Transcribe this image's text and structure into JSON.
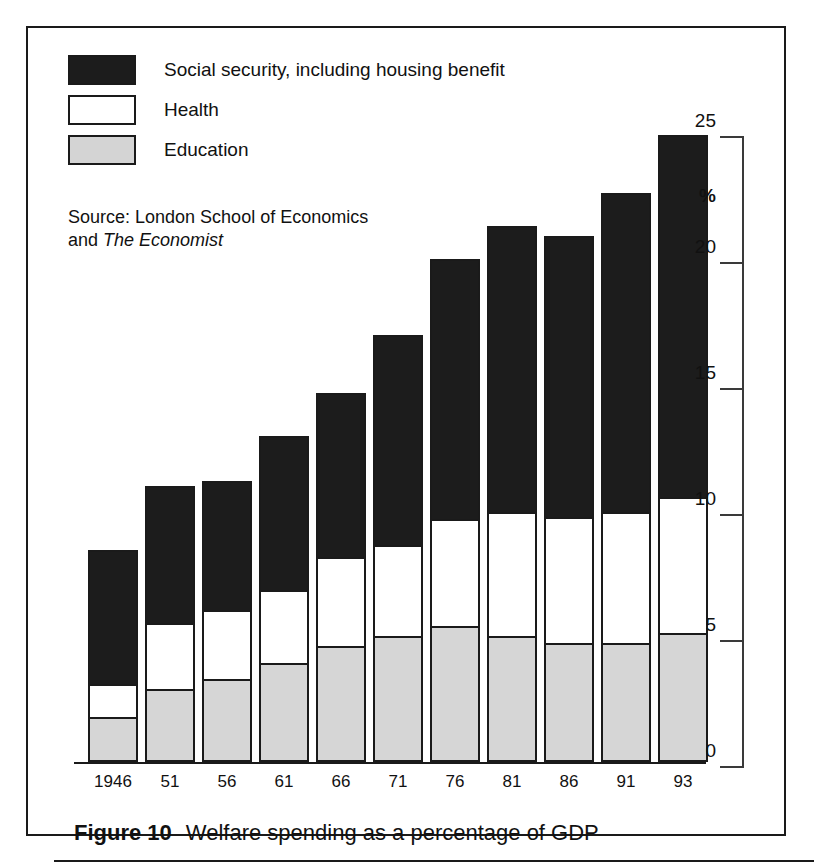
{
  "figure": {
    "number_label": "Figure 10",
    "caption": "Welfare spending as a percentage of GDP"
  },
  "source": {
    "line1": "Source: London School of Economics",
    "line2_prefix": "and ",
    "line2_italic": "The Economist"
  },
  "legend": {
    "items": [
      {
        "key": "social",
        "label": "Social security, including housing benefit",
        "color": "#1c1c1c"
      },
      {
        "key": "health",
        "label": "Health",
        "color": "#ffffff"
      },
      {
        "key": "education",
        "label": "Education",
        "color": "#d6d6d6"
      }
    ]
  },
  "axis": {
    "y_unit_symbol": "%",
    "y_ticks": [
      "0",
      "5",
      "10",
      "15",
      "20",
      "25"
    ]
  },
  "chart_data": {
    "type": "bar",
    "stacked": true,
    "title": "Welfare spending as a percentage of GDP",
    "xlabel": "",
    "ylabel": "%",
    "ylim": [
      0,
      25
    ],
    "yticks": [
      0,
      5,
      10,
      15,
      20,
      25
    ],
    "grid": false,
    "legend_position": "top-left",
    "categories": [
      "1946",
      "51",
      "56",
      "61",
      "66",
      "71",
      "76",
      "81",
      "86",
      "91",
      "93"
    ],
    "series": [
      {
        "name": "Education",
        "color": "#d6d6d6",
        "values": [
          1.8,
          2.9,
          3.3,
          3.9,
          4.6,
          5.0,
          5.4,
          5.0,
          4.7,
          4.7,
          5.1
        ]
      },
      {
        "name": "Health",
        "color": "#ffffff",
        "values": [
          1.3,
          2.6,
          2.7,
          2.9,
          3.5,
          3.6,
          4.2,
          4.9,
          5.0,
          5.2,
          5.4
        ]
      },
      {
        "name": "Social security, including housing benefit",
        "color": "#1c1c1c",
        "values": [
          5.3,
          5.4,
          5.1,
          6.1,
          6.5,
          8.3,
          10.3,
          11.3,
          11.1,
          12.6,
          14.3
        ]
      }
    ],
    "totals": [
      8.4,
      10.9,
      11.1,
      12.9,
      14.6,
      16.9,
      19.9,
      21.2,
      20.8,
      22.5,
      24.8
    ],
    "annotations": [
      "Source: London School of Economics",
      "and The Economist"
    ]
  }
}
